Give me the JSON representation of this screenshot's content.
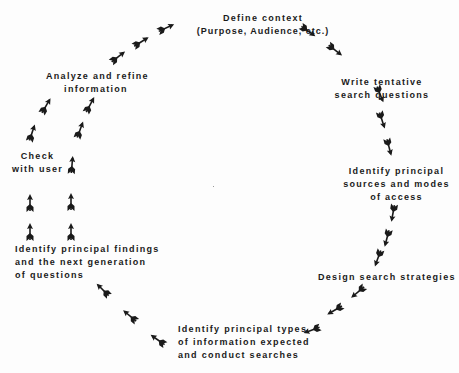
{
  "diagram": {
    "type": "cycle",
    "direction": "clockwise",
    "colors": {
      "ink": "#1a1a1a",
      "background": "#fdfdfd"
    },
    "nodes": [
      {
        "id": "define",
        "lines": [
          "Define context",
          "(Purpose, Audience, etc.)"
        ]
      },
      {
        "id": "write",
        "lines": [
          "Write tentative",
          "search questions"
        ]
      },
      {
        "id": "identify_sources",
        "lines": [
          "Identify principal",
          "sources and modes",
          "of access"
        ]
      },
      {
        "id": "design",
        "lines": [
          "Design search strategies"
        ]
      },
      {
        "id": "identify_types",
        "lines": [
          "Identify principal types",
          "of information expected",
          "and conduct searches"
        ]
      },
      {
        "id": "identify_findings",
        "lines": [
          "Identify principal findings",
          "and the next generation",
          "of questions"
        ]
      },
      {
        "id": "check",
        "lines": [
          "Check",
          "with user"
        ]
      },
      {
        "id": "analyze",
        "lines": [
          "Analyze and refine",
          "information"
        ]
      }
    ],
    "edges": [
      {
        "from": "define",
        "to": "write"
      },
      {
        "from": "write",
        "to": "identify_sources"
      },
      {
        "from": "identify_sources",
        "to": "design"
      },
      {
        "from": "design",
        "to": "identify_types"
      },
      {
        "from": "identify_types",
        "to": "identify_findings"
      },
      {
        "from": "identify_findings",
        "to": "check"
      },
      {
        "from": "identify_findings",
        "to": "analyze"
      },
      {
        "from": "check",
        "to": "analyze"
      },
      {
        "from": "analyze",
        "to": "define"
      }
    ]
  }
}
